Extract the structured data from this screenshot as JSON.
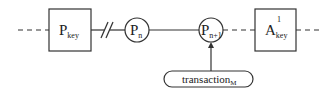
{
  "diagram": {
    "nodes": {
      "p_key": {
        "base": "P",
        "subscript": "key",
        "shape": "box"
      },
      "p_n": {
        "base": "P",
        "subscript": "n",
        "shape": "circle"
      },
      "p_n1": {
        "base": "P",
        "subscript": "n+1",
        "shape": "circle"
      },
      "a_key": {
        "base": "A",
        "subscript": "key",
        "superscript": "1",
        "shape": "box"
      },
      "transaction": {
        "base": "transaction",
        "subscript": "M",
        "shape": "pill"
      }
    },
    "edges": [
      {
        "from": "left-continuation",
        "to": "p_key",
        "style": "dashed"
      },
      {
        "from": "p_key",
        "to": "p_n",
        "style": "solid-with-break"
      },
      {
        "from": "p_n",
        "to": "p_n1",
        "style": "solid"
      },
      {
        "from": "p_n1",
        "to": "a_key",
        "style": "dashed"
      },
      {
        "from": "a_key",
        "to": "right-continuation",
        "style": "dashed"
      },
      {
        "from": "transaction",
        "to": "p_n1",
        "style": "arrow"
      }
    ],
    "colors": {
      "stroke": "#333333",
      "text": "#222222",
      "background": "#ffffff"
    }
  }
}
